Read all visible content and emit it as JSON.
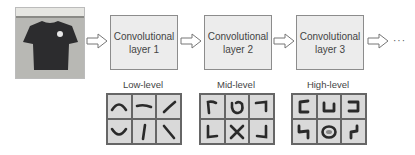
{
  "input": {
    "label": "t-shirt photo",
    "icon": "tshirt-photo"
  },
  "layers": [
    {
      "name": "Convolutional",
      "number": "layer 1",
      "feature_level": "Low-level"
    },
    {
      "name": "Convolutional",
      "number": "layer 2",
      "feature_level": "Mid-level"
    },
    {
      "name": "Convolutional",
      "number": "layer 3",
      "feature_level": "High-level"
    }
  ],
  "continuation": "···",
  "feature_grids": {
    "low": [
      "arc-top",
      "dash",
      "slash",
      "arc-bottom",
      "vertical-stroke",
      "backslash"
    ],
    "mid": [
      "corner-top-left",
      "loop",
      "corner-top-right",
      "corner-bottom-left",
      "cross",
      "corner-bottom-right"
    ],
    "high": [
      "bracket-left",
      "cup",
      "bracket-right",
      "hook",
      "logo-circle",
      "squiggle"
    ]
  },
  "colors": {
    "box_fill": "#ececec",
    "box_border": "#8c8c8c",
    "grid_fill": "#d9d9d9",
    "stroke": "#2a2a2a"
  }
}
